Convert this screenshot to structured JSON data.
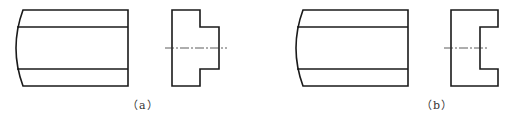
{
  "figures": [
    {
      "id": "a",
      "caption": "（a）",
      "front_view": {
        "description": "rectangular front view with convex curved left edge and two horizontal inner lines"
      },
      "side_view": {
        "description": "T-shaped profile: protruding tab on right side, horizontal dash-dot centerline"
      }
    },
    {
      "id": "b",
      "caption": "（b）",
      "front_view": {
        "description": "rectangular front view with convex curved left edge and two horizontal inner lines"
      },
      "side_view": {
        "description": "C-shaped profile: notch cut into right side, horizontal dash-dot centerline"
      }
    }
  ],
  "colors": {
    "line": "#1a1a1a",
    "background": "#ffffff"
  }
}
